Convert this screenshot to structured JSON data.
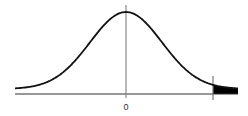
{
  "chart_data": {
    "type": "area",
    "title": "",
    "xlabel": "",
    "ylabel": "",
    "distribution": "normal",
    "mean": 0,
    "x_tick_labels": [
      "0"
    ],
    "shaded_region": "right tail beyond critical value",
    "critical_line_label": "",
    "grid": false,
    "legend": null,
    "colors": {
      "curve": "#111111",
      "axis": "#333333",
      "center_line": "#888888",
      "shade": "#000000"
    }
  },
  "axis": {
    "center_tick_label": "0"
  }
}
